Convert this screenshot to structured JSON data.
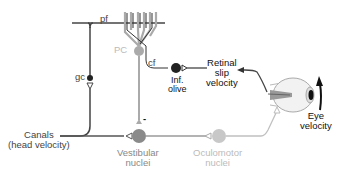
{
  "diagram": {
    "labels": {
      "pf": "pf",
      "pc": "PC",
      "cf": "cf",
      "gc": "gc",
      "inf_olive_line1": "Inf.",
      "inf_olive_line2": "olive",
      "retinal_line1": "Retinal",
      "retinal_line2": "slip",
      "retinal_line3": "velocity",
      "canals_line1": "Canals",
      "canals_line2": "(head velocity)",
      "vestibular_line1": "Vestibular",
      "vestibular_line2": "nuclei",
      "oculomotor_line1": "Oculomotor",
      "oculomotor_line2": "nuclei",
      "eye_line1": "Eye",
      "eye_line2": "velocity",
      "inhibitory_sign": "-"
    },
    "colors": {
      "dark": "#444444",
      "mid": "#8a8a8a",
      "light": "#bdbdbd",
      "black": "#111111"
    }
  }
}
